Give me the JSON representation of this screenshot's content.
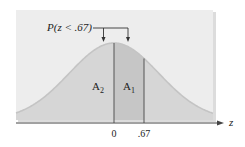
{
  "chart_data": {
    "type": "area",
    "title": "",
    "distribution": "standard normal",
    "xlabel": "z",
    "ylabel": "",
    "x_ticks": [
      {
        "value": 0,
        "label": "0"
      },
      {
        "value": 0.67,
        "label": ".67"
      }
    ],
    "annotation": "P(z < .67)",
    "regions": [
      {
        "name": "A2",
        "label": "A",
        "subscript": "2",
        "from": "-inf",
        "to": 0
      },
      {
        "name": "A1",
        "label": "A",
        "subscript": "1",
        "from": 0,
        "to": 0.67
      }
    ],
    "grid": false,
    "legend": null
  },
  "labels": {
    "annotation": "P(z < .67)",
    "axis_z": "z",
    "tick_0": "0",
    "tick_067": ".67",
    "a2_main": "A",
    "a2_sub": "2",
    "a1_main": "A",
    "a1_sub": "1"
  },
  "colors": {
    "panel": "#ededed",
    "area_a2": "#d6d6d6",
    "area_a1": "#c6c6c6",
    "curve": "#c8c8c8",
    "line": "#444444"
  }
}
